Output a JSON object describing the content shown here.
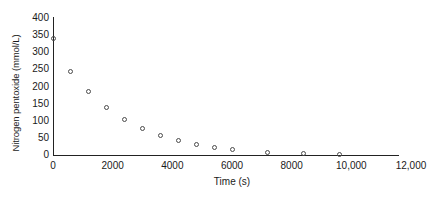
{
  "chart_data": {
    "type": "scatter",
    "title": "",
    "xlabel": "Time (s)",
    "ylabel": "Nitrogen pentoxide (mmol/L)",
    "xlim": [
      0,
      12000
    ],
    "ylim": [
      0,
      400
    ],
    "grid": false,
    "legend": null,
    "marker_style": "open-circle",
    "xticks": [
      0,
      2000,
      4000,
      6000,
      8000,
      10000,
      12000
    ],
    "xtick_labels": [
      "0",
      "2000",
      "4000",
      "6000",
      "8000",
      "10,000",
      "12,000"
    ],
    "yticks": [
      0,
      50,
      100,
      150,
      200,
      250,
      300,
      350,
      400
    ],
    "ytick_labels": [
      "0",
      "50",
      "100",
      "150",
      "200",
      "250",
      "300",
      "350",
      "400"
    ],
    "x": [
      0,
      600,
      1200,
      1800,
      2400,
      3000,
      3600,
      4200,
      4800,
      5400,
      6000,
      7200,
      8400,
      9600
    ],
    "y": [
      340,
      245,
      185,
      140,
      104,
      78,
      57,
      42,
      31,
      22,
      16,
      8,
      3,
      2
    ],
    "points": [
      {
        "x": 0,
        "y": 340
      },
      {
        "x": 600,
        "y": 245
      },
      {
        "x": 1200,
        "y": 185
      },
      {
        "x": 1800,
        "y": 140
      },
      {
        "x": 2400,
        "y": 104
      },
      {
        "x": 3000,
        "y": 78
      },
      {
        "x": 3600,
        "y": 57
      },
      {
        "x": 4200,
        "y": 42
      },
      {
        "x": 4800,
        "y": 31
      },
      {
        "x": 5400,
        "y": 22
      },
      {
        "x": 6000,
        "y": 16
      },
      {
        "x": 7200,
        "y": 8
      },
      {
        "x": 8400,
        "y": 3
      },
      {
        "x": 9600,
        "y": 2
      }
    ]
  },
  "colors": {
    "axis": "#222222",
    "marker_stroke": "#4a4a4a",
    "text": "#1a1a1a",
    "background": "#ffffff"
  }
}
